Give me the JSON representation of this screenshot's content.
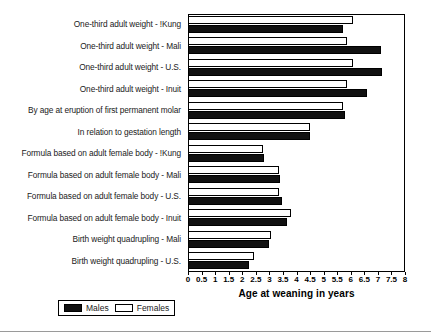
{
  "chart_data": {
    "type": "bar",
    "orientation": "horizontal",
    "title": "",
    "xlabel": "Age at weaning in years",
    "ylabel": "",
    "xlim": [
      0,
      8
    ],
    "xticks": [
      "0",
      "0.5",
      "1",
      "1.5",
      "2",
      "2.5",
      "3",
      "3.5",
      "4",
      "4.5",
      "5",
      "5.5",
      "6",
      "6.5",
      "7",
      "7.5",
      "8"
    ],
    "xtick_values": [
      0,
      0.5,
      1,
      1.5,
      2,
      2.5,
      3,
      3.5,
      4,
      4.5,
      5,
      5.5,
      6,
      6.5,
      7,
      7.5,
      8
    ],
    "grid": false,
    "legend_position": "bottom-left",
    "categories": [
      "One-third adult weight - !Kung",
      "One-third adult weight - Mali",
      "One-third adult weight - U.S.",
      "One-third adult weight - Inuit",
      "By age at eruption of first permanent molar",
      "In relation to gestation length",
      "Formula based on adult female body - !Kung",
      "Formula based on adult female body - Mali",
      "Formula based on adult female body - U.S.",
      "Formula based on adult female body - Inuit",
      "Birth weight quadrupling - Mali",
      "Birth weight quadrupling - U.S."
    ],
    "series": [
      {
        "name": "Males",
        "color": "#111111",
        "values": [
          5.7,
          7.1,
          7.15,
          6.6,
          5.8,
          4.5,
          2.8,
          3.4,
          3.45,
          3.65,
          3.0,
          2.25
        ]
      },
      {
        "name": "Females",
        "color": "#ffffff",
        "values": [
          6.1,
          5.85,
          6.1,
          5.85,
          5.7,
          4.5,
          2.75,
          3.35,
          3.35,
          3.8,
          3.05,
          2.45
        ]
      }
    ]
  },
  "legend": {
    "items": [
      {
        "label": "Males",
        "swatch": "black"
      },
      {
        "label": "Females",
        "swatch": "white"
      }
    ]
  }
}
